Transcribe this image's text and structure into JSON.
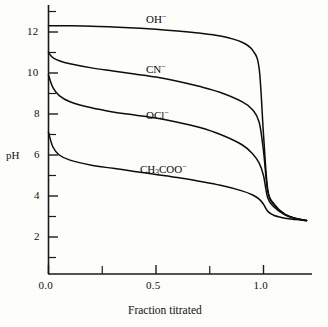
{
  "chart_data": {
    "type": "line",
    "title": "",
    "xlabel": "Fraction titrated",
    "ylabel": "pH",
    "xlim": [
      -0.02,
      1.23
    ],
    "ylim": [
      0.2,
      13.35
    ],
    "grid": false,
    "legend": "inline-curve-labels",
    "x_ticks_major": [
      "0.0",
      "0.5",
      "1.0"
    ],
    "x_tick_values_major": [
      0.0,
      0.5,
      1.0
    ],
    "x_tick_values_minor": [
      0.25,
      0.75,
      1.25
    ],
    "y_ticks_major": [
      "2",
      "4",
      "6",
      "8",
      "10",
      "12"
    ],
    "y_tick_values_major": [
      2,
      4,
      6,
      8,
      10,
      12
    ],
    "y_tick_values_minor": [
      1,
      3,
      5,
      7,
      9,
      11,
      13
    ],
    "series": [
      {
        "name": "OH⁻",
        "label": "OH",
        "charge": "−",
        "label_x": 0.45,
        "label_y": 12.95,
        "start_ph": 12.3,
        "equivalence_ph": 7.0,
        "end_ph": 2.8,
        "x": [
          0.0,
          0.05,
          0.1,
          0.2,
          0.3,
          0.4,
          0.5,
          0.6,
          0.7,
          0.8,
          0.9,
          0.95,
          0.98,
          1.0,
          1.02,
          1.05,
          1.1,
          1.15,
          1.2
        ],
        "y": [
          12.3,
          12.3,
          12.3,
          12.28,
          12.25,
          12.2,
          12.13,
          12.05,
          11.95,
          11.8,
          11.5,
          11.1,
          10.2,
          7.0,
          4.3,
          3.6,
          3.1,
          2.9,
          2.8
        ]
      },
      {
        "name": "CN⁻",
        "label": "CN",
        "charge": "−",
        "label_x": 0.45,
        "label_y": 10.6,
        "start_ph": 11.0,
        "equivalence_ph": 6.2,
        "end_ph": 2.8,
        "x": [
          0.0,
          0.02,
          0.05,
          0.1,
          0.2,
          0.3,
          0.4,
          0.5,
          0.6,
          0.7,
          0.8,
          0.9,
          0.95,
          0.98,
          1.0,
          1.02,
          1.05,
          1.1,
          1.15,
          1.2
        ],
        "y": [
          11.0,
          10.75,
          10.6,
          10.45,
          10.25,
          10.1,
          9.95,
          9.8,
          9.6,
          9.35,
          9.05,
          8.6,
          8.2,
          7.6,
          6.2,
          4.2,
          3.55,
          3.1,
          2.9,
          2.8
        ]
      },
      {
        "name": "OCl⁻",
        "label": "OCl",
        "charge": "−",
        "label_x": 0.45,
        "label_y": 8.4,
        "start_ph": 9.9,
        "equivalence_ph": 5.0,
        "end_ph": 2.8,
        "x": [
          0.0,
          0.02,
          0.05,
          0.1,
          0.2,
          0.3,
          0.4,
          0.5,
          0.6,
          0.7,
          0.8,
          0.9,
          0.95,
          0.98,
          1.0,
          1.02,
          1.05,
          1.1,
          1.15,
          1.2
        ],
        "y": [
          9.9,
          9.3,
          8.9,
          8.6,
          8.3,
          8.1,
          7.95,
          7.8,
          7.6,
          7.35,
          7.0,
          6.5,
          6.05,
          5.6,
          5.0,
          3.9,
          3.45,
          3.08,
          2.9,
          2.8
        ]
      },
      {
        "name": "CH₃COO⁻",
        "label": "CH",
        "label_sub": "3",
        "label_tail": "COO",
        "charge": "−",
        "label_x": 0.45,
        "label_y": 5.9,
        "start_ph": 7.1,
        "equivalence_ph": 3.6,
        "end_ph": 2.8,
        "x": [
          0.0,
          0.02,
          0.05,
          0.1,
          0.2,
          0.3,
          0.4,
          0.5,
          0.6,
          0.7,
          0.8,
          0.9,
          0.95,
          0.98,
          1.0,
          1.02,
          1.05,
          1.1,
          1.15,
          1.2
        ],
        "y": [
          7.1,
          6.4,
          6.0,
          5.75,
          5.5,
          5.35,
          5.2,
          5.05,
          4.9,
          4.72,
          4.52,
          4.25,
          4.05,
          3.85,
          3.6,
          3.25,
          3.05,
          2.92,
          2.85,
          2.8
        ]
      }
    ]
  },
  "axes": {
    "y_axis_name": "pH",
    "x_axis_name": "Fraction titrated"
  },
  "colors": {
    "curve": "#0d0d0d",
    "axis": "#1a1a1a",
    "background": "#fdfdfa",
    "text": "#111111"
  }
}
